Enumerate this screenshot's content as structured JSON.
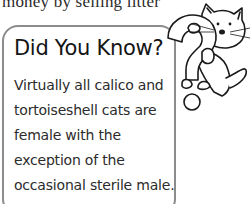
{
  "page": {
    "top_text": "money by selling litter"
  },
  "fact_box": {
    "title": "Did You Know?",
    "body": "Virtually all calico and tortoiseshell cats are female with the exception of the occasional sterile male.",
    "border_color": "#8c8c8c"
  },
  "illustration": {
    "icon": "cat-with-question-mark-icon"
  }
}
